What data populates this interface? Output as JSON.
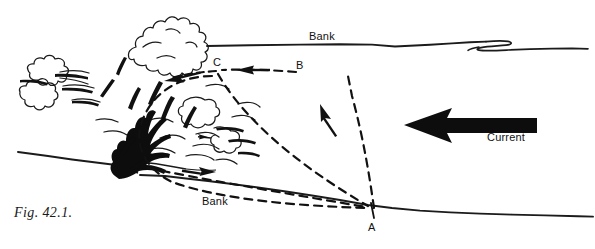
{
  "figure": {
    "caption": "Fig. 42.1.",
    "background_color": "#ffffff",
    "ink_color": "#111111"
  },
  "labels": {
    "bank_far": "Bank",
    "bank_near": "Bank",
    "current": "Current",
    "point_a": "A",
    "point_b": "B",
    "point_c": "C"
  },
  "icons": {
    "current_arrow": "left-arrow-icon",
    "cast_arrow_b_to_c": "left-arrow-icon",
    "cast_arrow_c_to_tree": "left-arrow-icon",
    "cast_arrow_a_to_b": "up-left-arrow-icon",
    "retrieve_arrow_tree_to_a": "right-arrow-icon"
  },
  "scene": {
    "far_bank": "far-bank-line",
    "near_bank": "near-bank-line",
    "vegetation": "bush-foliage-outline",
    "trunk": "dark-trunk-silhouette",
    "casting_path": "dashed-casting-path-a-b-c"
  }
}
